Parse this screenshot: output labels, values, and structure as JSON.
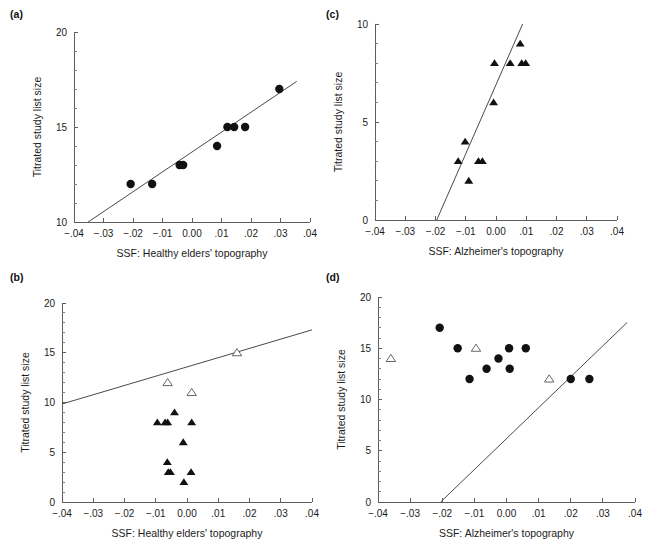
{
  "figure": {
    "panels": [
      {
        "id": "a",
        "tag": "(a)",
        "xlabel": "SSF: Healthy elders' topography",
        "ylabel": "Titrated study list size",
        "xticks": [
          "−.04",
          "−.03",
          "−.02",
          "−.01",
          "0.00",
          ".01",
          ".02",
          ".03",
          ".04"
        ],
        "xtickvals": [
          -0.04,
          -0.03,
          -0.02,
          -0.01,
          0.0,
          0.01,
          0.02,
          0.03,
          0.04
        ],
        "yticks": [
          "10",
          "15",
          "20"
        ],
        "ytickvals": [
          10,
          15,
          20
        ],
        "chart_data": {
          "type": "scatter",
          "title": "",
          "xlabel": "SSF: Healthy elders' topography",
          "ylabel": "Titrated study list size",
          "xlim": [
            -0.04,
            0.04
          ],
          "ylim": [
            10,
            20
          ],
          "grid": false,
          "legend": "none",
          "series": [
            {
              "name": "healthy elders (filled circles)",
              "marker": "circle-filled",
              "points": [
                [
                  -0.0208,
                  12
                ],
                [
                  -0.0135,
                  12
                ],
                [
                  -0.0042,
                  13
                ],
                [
                  -0.003,
                  13
                ],
                [
                  0.0085,
                  14
                ],
                [
                  0.012,
                  15
                ],
                [
                  0.0143,
                  15
                ],
                [
                  0.018,
                  15
                ],
                [
                  0.0296,
                  17
                ]
              ]
            }
          ],
          "trendline": {
            "x0": -0.0352,
            "y0": 10.0,
            "x1": 0.0355,
            "y1": 17.4
          }
        }
      },
      {
        "id": "c",
        "tag": "(c)",
        "xlabel": "SSF: Alzheimer's topography",
        "ylabel": "Titrated study list size",
        "xticks": [
          "−.04",
          "−.03",
          "−.02",
          "−.01",
          "0.00",
          ".01",
          ".02",
          ".03",
          ".04"
        ],
        "xtickvals": [
          -0.04,
          -0.03,
          -0.02,
          -0.01,
          0.0,
          0.01,
          0.02,
          0.03,
          0.04
        ],
        "yticks": [
          "0",
          "5",
          "10"
        ],
        "ytickvals": [
          0,
          5,
          10
        ],
        "chart_data": {
          "type": "scatter",
          "title": "",
          "xlabel": "SSF: Alzheimer's topography",
          "ylabel": "Titrated study list size",
          "xlim": [
            -0.04,
            0.04
          ],
          "ylim": [
            0,
            10
          ],
          "grid": false,
          "legend": "none",
          "series": [
            {
              "name": "Alzheimer's patients (filled triangles)",
              "marker": "triangle-filled",
              "points": [
                [
                  -0.0125,
                  3
                ],
                [
                  -0.0102,
                  4
                ],
                [
                  -0.009,
                  2
                ],
                [
                  -0.0058,
                  3
                ],
                [
                  -0.0045,
                  3
                ],
                [
                  -0.0008,
                  6
                ],
                [
                  -0.0005,
                  8
                ],
                [
                  0.0047,
                  8
                ],
                [
                  0.008,
                  9
                ],
                [
                  0.0085,
                  8
                ],
                [
                  0.0098,
                  8
                ]
              ]
            }
          ],
          "trendline": {
            "x0": -0.0196,
            "y0": 0.0,
            "x1": 0.0088,
            "y1": 10.0
          }
        }
      },
      {
        "id": "b",
        "tag": "(b)",
        "xlabel": "SSF: Healthy elders' topography",
        "ylabel": "Titrated study list size",
        "xticks": [
          "−.04",
          "−.03",
          "−.02",
          "−.01",
          "0.00",
          ".01",
          ".02",
          ".03",
          ".04"
        ],
        "xtickvals": [
          -0.04,
          -0.03,
          -0.02,
          -0.01,
          0.0,
          0.01,
          0.02,
          0.03,
          0.04
        ],
        "yticks": [
          "0",
          "5",
          "10",
          "15",
          "20"
        ],
        "ytickvals": [
          0,
          5,
          10,
          15,
          20
        ],
        "chart_data": {
          "type": "scatter",
          "title": "",
          "xlabel": "SSF: Healthy elders' topography",
          "ylabel": "Titrated study list size",
          "xlim": [
            -0.04,
            0.04
          ],
          "ylim": [
            0,
            20
          ],
          "grid": false,
          "legend": "none",
          "series": [
            {
              "name": "Alzheimer's patients (filled triangles)",
              "marker": "triangle-filled",
              "points": [
                [
                  -0.0095,
                  8
                ],
                [
                  -0.007,
                  8
                ],
                [
                  -0.0062,
                  8
                ],
                [
                  -0.006,
                  3
                ],
                [
                  -0.0053,
                  3
                ],
                [
                  -0.0063,
                  4
                ],
                [
                  -0.004,
                  9
                ],
                [
                  -0.0012,
                  6
                ],
                [
                  -0.001,
                  2
                ],
                [
                  0.0015,
                  8
                ],
                [
                  0.0013,
                  3
                ]
              ]
            },
            {
              "name": "healthy elders (open triangles)",
              "marker": "triangle-open",
              "points": [
                [
                  -0.0062,
                  12
                ],
                [
                  0.0015,
                  11
                ],
                [
                  0.016,
                  15
                ]
              ]
            }
          ],
          "trendline": {
            "x0": -0.04,
            "y0": 9.85,
            "x1": 0.04,
            "y1": 17.3
          }
        }
      },
      {
        "id": "d",
        "tag": "(d)",
        "xlabel": "SSF: Alzheimer's topography",
        "ylabel": "Titrated study list size",
        "xticks": [
          "−.04",
          "−.03",
          "−.02",
          "−.01",
          "0.00",
          ".01",
          ".02",
          ".03",
          ".04"
        ],
        "xtickvals": [
          -0.04,
          -0.03,
          -0.02,
          -0.01,
          0.0,
          0.01,
          0.02,
          0.03,
          0.04
        ],
        "yticks": [
          "0",
          "5",
          "10",
          "15",
          "20"
        ],
        "ytickvals": [
          0,
          5,
          10,
          15,
          20
        ],
        "chart_data": {
          "type": "scatter",
          "title": "",
          "xlabel": "SSF: Alzheimer's topography",
          "ylabel": "Titrated study list size",
          "xlim": [
            -0.04,
            0.04
          ],
          "ylim": [
            0,
            20
          ],
          "grid": false,
          "legend": "none",
          "series": [
            {
              "name": "healthy elders (filled circles)",
              "marker": "circle-filled",
              "points": [
                [
                  -0.0208,
                  17
                ],
                [
                  -0.0152,
                  15
                ],
                [
                  -0.0115,
                  12
                ],
                [
                  -0.0062,
                  13
                ],
                [
                  -0.0025,
                  14
                ],
                [
                  0.0008,
                  15
                ],
                [
                  0.001,
                  13
                ],
                [
                  0.006,
                  15
                ],
                [
                  0.02,
                  12
                ],
                [
                  0.0258,
                  12
                ]
              ]
            },
            {
              "name": "Alzheimer's patients (open triangles)",
              "marker": "triangle-open",
              "points": [
                [
                  -0.036,
                  14
                ],
                [
                  -0.0095,
                  15
                ],
                [
                  0.0133,
                  12
                ]
              ]
            }
          ],
          "trendline": {
            "x0": -0.0205,
            "y0": 0.0,
            "x1": 0.0375,
            "y1": 17.5
          }
        }
      }
    ]
  }
}
